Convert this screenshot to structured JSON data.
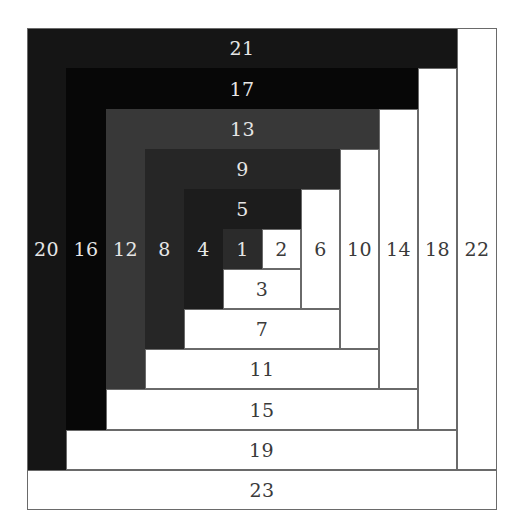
{
  "diagram": {
    "colors": {
      "light_fill": "#ffffff",
      "outline": "#6a6a6a",
      "label_on_dark": "#e6e6e6",
      "label_on_light": "#3a3a3a"
    },
    "grid": {
      "col_edges": [
        27,
        66,
        106,
        145,
        184,
        223,
        262,
        301,
        340,
        379,
        418,
        457,
        497
      ],
      "row_edges": [
        28,
        68,
        109,
        149,
        189,
        229,
        269,
        309,
        349,
        389,
        430,
        470,
        510
      ],
      "label_row_y": 249
    },
    "pieces": [
      {
        "label": "1",
        "tone": "dark",
        "fill": "#2b2b2b",
        "c": [
          5,
          6
        ],
        "r": [
          5,
          6
        ],
        "orient": "square"
      },
      {
        "label": "2",
        "tone": "light",
        "fill": "#ffffff",
        "c": [
          6,
          7
        ],
        "r": [
          5,
          6
        ],
        "orient": "square"
      },
      {
        "label": "3",
        "tone": "light",
        "fill": "#ffffff",
        "c": [
          5,
          7
        ],
        "r": [
          6,
          7
        ],
        "orient": "horizontal"
      },
      {
        "label": "4",
        "tone": "dark",
        "fill": "#1c1c1c",
        "c": [
          4,
          5
        ],
        "r": [
          5,
          7
        ],
        "orient": "vertical"
      },
      {
        "label": "5",
        "tone": "dark",
        "fill": "#1c1c1c",
        "c": [
          4,
          7
        ],
        "r": [
          4,
          5
        ],
        "orient": "horizontal"
      },
      {
        "label": "6",
        "tone": "light",
        "fill": "#ffffff",
        "c": [
          7,
          8
        ],
        "r": [
          4,
          7
        ],
        "orient": "vertical"
      },
      {
        "label": "7",
        "tone": "light",
        "fill": "#ffffff",
        "c": [
          4,
          8
        ],
        "r": [
          7,
          8
        ],
        "orient": "horizontal"
      },
      {
        "label": "8",
        "tone": "dark",
        "fill": "#262626",
        "c": [
          3,
          4
        ],
        "r": [
          4,
          8
        ],
        "orient": "vertical"
      },
      {
        "label": "9",
        "tone": "dark",
        "fill": "#262626",
        "c": [
          3,
          8
        ],
        "r": [
          3,
          4
        ],
        "orient": "horizontal"
      },
      {
        "label": "10",
        "tone": "light",
        "fill": "#ffffff",
        "c": [
          8,
          9
        ],
        "r": [
          3,
          8
        ],
        "orient": "vertical"
      },
      {
        "label": "11",
        "tone": "light",
        "fill": "#ffffff",
        "c": [
          3,
          9
        ],
        "r": [
          8,
          9
        ],
        "orient": "horizontal"
      },
      {
        "label": "12",
        "tone": "dark",
        "fill": "#383838",
        "c": [
          2,
          3
        ],
        "r": [
          3,
          9
        ],
        "orient": "vertical"
      },
      {
        "label": "13",
        "tone": "dark",
        "fill": "#383838",
        "c": [
          2,
          9
        ],
        "r": [
          2,
          3
        ],
        "orient": "horizontal"
      },
      {
        "label": "14",
        "tone": "light",
        "fill": "#ffffff",
        "c": [
          9,
          10
        ],
        "r": [
          2,
          9
        ],
        "orient": "vertical"
      },
      {
        "label": "15",
        "tone": "light",
        "fill": "#ffffff",
        "c": [
          2,
          10
        ],
        "r": [
          9,
          10
        ],
        "orient": "horizontal"
      },
      {
        "label": "16",
        "tone": "dark",
        "fill": "#070707",
        "c": [
          1,
          2
        ],
        "r": [
          2,
          10
        ],
        "orient": "vertical"
      },
      {
        "label": "17",
        "tone": "dark",
        "fill": "#070707",
        "c": [
          1,
          10
        ],
        "r": [
          1,
          2
        ],
        "orient": "horizontal"
      },
      {
        "label": "18",
        "tone": "light",
        "fill": "#ffffff",
        "c": [
          10,
          11
        ],
        "r": [
          1,
          10
        ],
        "orient": "vertical"
      },
      {
        "label": "19",
        "tone": "light",
        "fill": "#ffffff",
        "c": [
          1,
          11
        ],
        "r": [
          10,
          11
        ],
        "orient": "horizontal"
      },
      {
        "label": "20",
        "tone": "dark",
        "fill": "#151515",
        "c": [
          0,
          1
        ],
        "r": [
          1,
          11
        ],
        "orient": "vertical"
      },
      {
        "label": "21",
        "tone": "dark",
        "fill": "#151515",
        "c": [
          0,
          11
        ],
        "r": [
          0,
          1
        ],
        "orient": "horizontal"
      },
      {
        "label": "22",
        "tone": "light",
        "fill": "#ffffff",
        "c": [
          11,
          12
        ],
        "r": [
          0,
          11
        ],
        "orient": "vertical"
      },
      {
        "label": "23",
        "tone": "light",
        "fill": "#ffffff",
        "c": [
          0,
          12
        ],
        "r": [
          11,
          12
        ],
        "orient": "horizontal"
      }
    ]
  }
}
